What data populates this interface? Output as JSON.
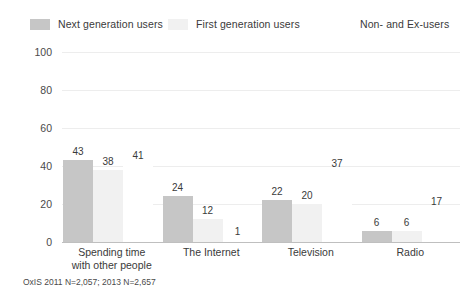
{
  "chart_data": {
    "type": "bar",
    "title": "",
    "xlabel": "",
    "ylabel": "% who say it is essential",
    "ylim": [
      0,
      100
    ],
    "yticks": [
      "0",
      "20",
      "40",
      "60",
      "80",
      "100"
    ],
    "grid": true,
    "legend_position": "top",
    "categories": [
      "Spending time\nwith other people",
      "The Internet",
      "Television",
      "Radio"
    ],
    "series": [
      {
        "name": "Next generation users",
        "color": "#c6c6c6",
        "values": [
          43,
          24,
          22,
          6
        ],
        "value_labels": [
          "43",
          "24",
          "22",
          "6"
        ]
      },
      {
        "name": "First generation users",
        "color": "#f1f1f1",
        "values": [
          38,
          12,
          20,
          6
        ],
        "value_labels": [
          "38",
          "12",
          "20",
          "6"
        ]
      },
      {
        "name": "Non- and Ex-users",
        "color": "#ffffff",
        "values": [
          41,
          1,
          37,
          17
        ],
        "value_labels": [
          "41",
          "1",
          "37",
          "17"
        ]
      }
    ],
    "footnote": "OxIS 2011 N=2,057; 2013 N=2,657"
  },
  "legend": {
    "items": [
      {
        "label": "Next generation users"
      },
      {
        "label": "First generation users"
      },
      {
        "label": "Non- and Ex-users"
      }
    ]
  },
  "colors": {
    "series_1": "#c6c6c6",
    "series_2": "#f1f1f1",
    "series_3": "#ffffff",
    "gridline": "#ededed",
    "baseline": "#bfbfbf",
    "text": "#3a3a3a"
  }
}
